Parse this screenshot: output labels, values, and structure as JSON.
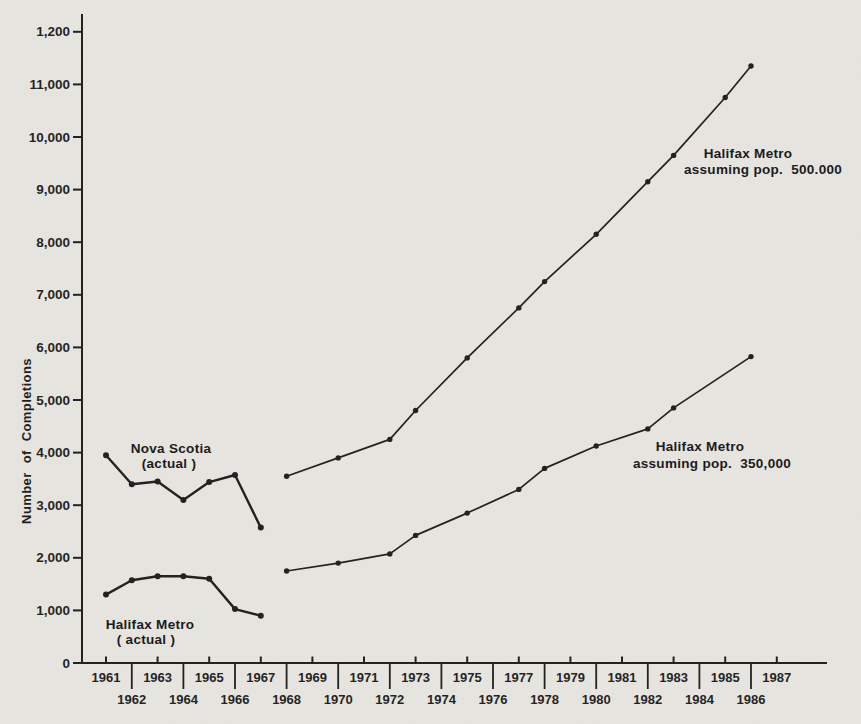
{
  "page": {
    "background": "#e7e5e0",
    "ink": "#1f1f1f"
  },
  "chart_data": {
    "type": "line",
    "title": "",
    "xlabel": "",
    "ylabel": "Number of Completions",
    "ylim": [
      0,
      12000
    ],
    "xlim": [
      1961,
      1987
    ],
    "grid": false,
    "legend_position": "inline-annotations",
    "y_ticks": {
      "values": [
        0,
        1000,
        2000,
        3000,
        4000,
        5000,
        6000,
        7000,
        8000,
        9000,
        10000,
        11000,
        12000
      ],
      "labels": [
        "0",
        "1,000",
        "2,000",
        "3,000",
        "4,000",
        "5,000",
        "6,000",
        "7,000",
        "8,000",
        "9,000",
        "10,000",
        "11,000",
        "1,200"
      ]
    },
    "x_ticks": {
      "years": [
        1961,
        1962,
        1963,
        1964,
        1965,
        1966,
        1967,
        1968,
        1969,
        1970,
        1971,
        1972,
        1973,
        1974,
        1975,
        1976,
        1977,
        1978,
        1979,
        1980,
        1981,
        1982,
        1983,
        1984,
        1985,
        1986,
        1987
      ],
      "top_row_years": [
        1961,
        1963,
        1965,
        1967,
        1969,
        1971,
        1973,
        1975,
        1977,
        1979,
        1981,
        1983,
        1985,
        1987
      ],
      "bottom_row_years": [
        1962,
        1964,
        1966,
        1968,
        1970,
        1972,
        1974,
        1976,
        1978,
        1980,
        1982,
        1984,
        1986
      ]
    },
    "series": [
      {
        "name": "Nova Scotia (actual)",
        "label_line1": "Nova Scotia",
        "label_line2": "(actual )",
        "style": "actual",
        "x": [
          1961,
          1962,
          1963,
          1964,
          1965,
          1966,
          1967
        ],
        "values": [
          3950,
          3400,
          3450,
          3100,
          3440,
          3575,
          2575
        ]
      },
      {
        "name": "Halifax Metro (actual)",
        "label_line1": "Halifax Metro",
        "label_line2": "( actual )",
        "style": "actual",
        "x": [
          1961,
          1962,
          1963,
          1964,
          1965,
          1966,
          1967
        ],
        "values": [
          1300,
          1575,
          1650,
          1650,
          1600,
          1025,
          900
        ]
      },
      {
        "name": "Halifax Metro assuming pop. 500.000",
        "label_line1": "Halifax Metro",
        "label_line2": "assuming pop.  500.000",
        "style": "projection",
        "x": [
          1968,
          1970,
          1972,
          1973,
          1975,
          1977,
          1978,
          1980,
          1982,
          1983,
          1985,
          1986
        ],
        "values": [
          3550,
          3900,
          4250,
          4800,
          5800,
          6750,
          7250,
          8150,
          9150,
          9650,
          10750,
          11350
        ]
      },
      {
        "name": "Halifax Metro assuming pop. 350,000",
        "label_line1": "Halifax Metro",
        "label_line2": "assuming pop.  350,000",
        "style": "projection",
        "x": [
          1968,
          1970,
          1972,
          1973,
          1975,
          1977,
          1978,
          1980,
          1982,
          1983,
          1986
        ],
        "values": [
          1750,
          1900,
          2075,
          2425,
          2850,
          3300,
          3700,
          4125,
          4450,
          4850,
          5825
        ]
      }
    ]
  }
}
